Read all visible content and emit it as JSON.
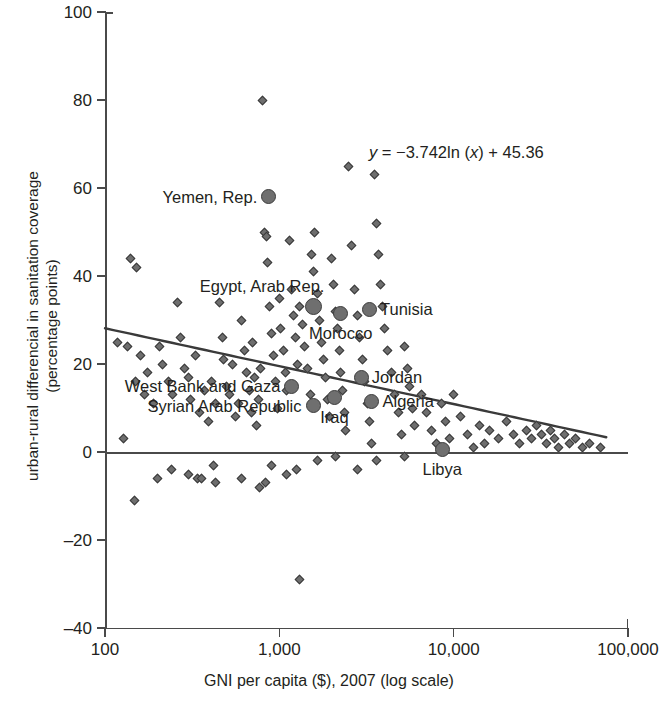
{
  "chart_data": {
    "type": "scatter",
    "title": "",
    "xlabel": "GNI per capita ($), 2007 (log scale)",
    "ylabel_line1": "urban-rural differencial in sanitation coverage",
    "ylabel_line2": "(percentage points)",
    "xscale": "log",
    "xlim": [
      100,
      100000
    ],
    "ylim": [
      -40,
      100
    ],
    "xticks": [
      100,
      1000,
      10000,
      100000
    ],
    "xticklabels": [
      "100",
      "1,000",
      "10,000",
      "100,000"
    ],
    "yticks": [
      -40,
      -20,
      0,
      20,
      40,
      60,
      80,
      100
    ],
    "yticklabels": [
      "–40",
      "–20",
      "0",
      "20",
      "40",
      "60",
      "80",
      "100"
    ],
    "grid": false,
    "legend": "none",
    "annotations": [
      {
        "name": "regression-equation",
        "text": "y = −3.742ln (x) + 45.36",
        "parts": {
          "y": "y",
          "eq": " = −3.742ln (",
          "x": "x",
          "tail": ") + 45.36"
        }
      }
    ],
    "reference_lines": [
      {
        "name": "zero-line",
        "orientation": "horizontal",
        "y": 0
      }
    ],
    "trendline": {
      "name": "logarithmic-trendline",
      "equation": "y = -3.742*ln(x) + 45.36",
      "slope": -3.742,
      "intercept": 45.36,
      "x_start": 100,
      "x_end": 75000
    },
    "highlighted_series": {
      "name": "Middle East and North Africa countries",
      "marker": "filled-circle",
      "color": "#6f6f6f",
      "points": [
        {
          "label": "Yemen, Rep.",
          "x": 870,
          "y": 58,
          "size": 15,
          "label_pos": "left"
        },
        {
          "label": "Egypt, Arab Rep.",
          "x": 1580,
          "y": 33,
          "size": 17,
          "label_pos": "above-left"
        },
        {
          "label": "Morocco",
          "x": 2250,
          "y": 31.5,
          "size": 15,
          "label_pos": "below"
        },
        {
          "label": "Tunisia",
          "x": 3290,
          "y": 32.5,
          "size": 15,
          "label_pos": "right"
        },
        {
          "label": "Jordan",
          "x": 2950,
          "y": 17,
          "size": 15,
          "label_pos": "right"
        },
        {
          "label": "West Bank and Gaza",
          "x": 1180,
          "y": 15,
          "size": 15,
          "label_pos": "left"
        },
        {
          "label": "Syrian Arab Republic",
          "x": 1560,
          "y": 10.5,
          "size": 15,
          "label_pos": "left"
        },
        {
          "label": "Iraq",
          "x": 2070,
          "y": 12.5,
          "size": 15,
          "label_pos": "below"
        },
        {
          "label": "Algeria",
          "x": 3400,
          "y": 11.5,
          "size": 15,
          "label_pos": "right"
        },
        {
          "label": "Libya",
          "x": 8600,
          "y": 0.5,
          "size": 15,
          "label_pos": "below"
        }
      ]
    },
    "background_series": {
      "name": "all developing countries",
      "marker": "small-diamond",
      "color": "#6e6e6e",
      "points": [
        [
          140,
          44
        ],
        [
          152,
          42
        ],
        [
          128,
          3
        ],
        [
          118,
          25
        ],
        [
          135,
          24
        ],
        [
          160,
          22
        ],
        [
          175,
          18
        ],
        [
          150,
          16
        ],
        [
          168,
          13
        ],
        [
          190,
          11
        ],
        [
          205,
          24
        ],
        [
          215,
          20
        ],
        [
          230,
          16
        ],
        [
          148,
          -11
        ],
        [
          200,
          -6
        ],
        [
          240,
          -4
        ],
        [
          260,
          34
        ],
        [
          270,
          26
        ],
        [
          285,
          19
        ],
        [
          300,
          17
        ],
        [
          245,
          13
        ],
        [
          310,
          12
        ],
        [
          330,
          22
        ],
        [
          350,
          9
        ],
        [
          370,
          14
        ],
        [
          390,
          7
        ],
        [
          300,
          -5
        ],
        [
          340,
          -6
        ],
        [
          360,
          -6
        ],
        [
          420,
          -3
        ],
        [
          410,
          16
        ],
        [
          430,
          11
        ],
        [
          455,
          34
        ],
        [
          470,
          26
        ],
        [
          480,
          21
        ],
        [
          495,
          15
        ],
        [
          520,
          13
        ],
        [
          540,
          20
        ],
        [
          560,
          8
        ],
        [
          580,
          11
        ],
        [
          610,
          30
        ],
        [
          630,
          23
        ],
        [
          650,
          18
        ],
        [
          670,
          14
        ],
        [
          690,
          9
        ],
        [
          700,
          25
        ],
        [
          720,
          17
        ],
        [
          740,
          6
        ],
        [
          760,
          12
        ],
        [
          780,
          19
        ],
        [
          800,
          80
        ],
        [
          820,
          50
        ],
        [
          840,
          49
        ],
        [
          860,
          43
        ],
        [
          880,
          33
        ],
        [
          900,
          27
        ],
        [
          920,
          22
        ],
        [
          950,
          16
        ],
        [
          980,
          10
        ],
        [
          1000,
          35
        ],
        [
          1020,
          28
        ],
        [
          1050,
          23
        ],
        [
          1080,
          18
        ],
        [
          1100,
          14
        ],
        [
          1150,
          48
        ],
        [
          1180,
          37
        ],
        [
          1210,
          31
        ],
        [
          1240,
          26
        ],
        [
          1270,
          20
        ],
        [
          1300,
          33
        ],
        [
          1350,
          29
        ],
        [
          1400,
          24
        ],
        [
          1450,
          19
        ],
        [
          1500,
          13
        ],
        [
          1520,
          45
        ],
        [
          1560,
          41
        ],
        [
          1600,
          50
        ],
        [
          1650,
          36
        ],
        [
          1700,
          30
        ],
        [
          1750,
          25
        ],
        [
          1800,
          21
        ],
        [
          1850,
          17
        ],
        [
          1900,
          12
        ],
        [
          1950,
          8
        ],
        [
          2000,
          44
        ],
        [
          2050,
          38
        ],
        [
          2100,
          32
        ],
        [
          2150,
          28
        ],
        [
          2200,
          23
        ],
        [
          2250,
          18
        ],
        [
          2300,
          14
        ],
        [
          2350,
          9
        ],
        [
          2400,
          5
        ],
        [
          2500,
          65
        ],
        [
          2600,
          47
        ],
        [
          2700,
          37
        ],
        [
          2800,
          31
        ],
        [
          2900,
          26
        ],
        [
          3000,
          21
        ],
        [
          3100,
          16
        ],
        [
          3200,
          11
        ],
        [
          3300,
          7
        ],
        [
          3400,
          2
        ],
        [
          3500,
          63
        ],
        [
          3600,
          52
        ],
        [
          3700,
          45
        ],
        [
          3800,
          38
        ],
        [
          3900,
          33
        ],
        [
          4000,
          28
        ],
        [
          4200,
          23
        ],
        [
          4400,
          18
        ],
        [
          4600,
          13
        ],
        [
          4800,
          9
        ],
        [
          5000,
          4
        ],
        [
          5200,
          24
        ],
        [
          5400,
          19
        ],
        [
          5600,
          15
        ],
        [
          5800,
          10
        ],
        [
          6000,
          6
        ],
        [
          6500,
          13
        ],
        [
          7000,
          9
        ],
        [
          7500,
          5
        ],
        [
          8000,
          2
        ],
        [
          8500,
          11
        ],
        [
          9000,
          7
        ],
        [
          9500,
          3
        ],
        [
          10000,
          13
        ],
        [
          11000,
          8
        ],
        [
          12000,
          4
        ],
        [
          13000,
          1
        ],
        [
          14000,
          6
        ],
        [
          15000,
          2
        ],
        [
          16000,
          5
        ],
        [
          18000,
          3
        ],
        [
          20000,
          7
        ],
        [
          22000,
          4
        ],
        [
          24000,
          2
        ],
        [
          26000,
          5
        ],
        [
          28000,
          3
        ],
        [
          30000,
          6
        ],
        [
          32000,
          4
        ],
        [
          34000,
          2
        ],
        [
          36000,
          5
        ],
        [
          38000,
          3
        ],
        [
          40000,
          1
        ],
        [
          43000,
          4
        ],
        [
          46000,
          2
        ],
        [
          50000,
          3
        ],
        [
          55000,
          1
        ],
        [
          60000,
          2
        ],
        [
          70000,
          1
        ],
        [
          1300,
          -29
        ],
        [
          900,
          -3
        ],
        [
          1100,
          -5
        ],
        [
          1250,
          -4
        ],
        [
          1650,
          -2
        ],
        [
          2100,
          -1
        ],
        [
          2800,
          -4
        ],
        [
          3600,
          -2
        ],
        [
          5200,
          -1
        ],
        [
          770,
          -8
        ],
        [
          830,
          -7
        ],
        [
          610,
          -6
        ],
        [
          430,
          -7
        ]
      ]
    }
  }
}
